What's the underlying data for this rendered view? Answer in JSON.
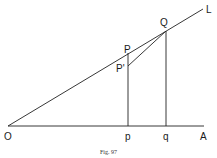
{
  "figure": {
    "caption": "Fig. 97",
    "labels": {
      "O": "O",
      "L": "L",
      "Q": "Q",
      "P": "P",
      "P_prime": "P'",
      "p": "p",
      "q": "q",
      "A": "A"
    },
    "points": {
      "O": [
        8,
        126
      ],
      "L": [
        203,
        9
      ],
      "Q": [
        166,
        31
      ],
      "P": [
        128,
        53
      ],
      "P_prime": [
        128,
        66
      ],
      "p": [
        128,
        126
      ],
      "q": [
        166,
        126
      ],
      "A": [
        204,
        126
      ]
    },
    "segments": [
      [
        "O",
        "L"
      ],
      [
        "O",
        "A"
      ],
      [
        "P",
        "p"
      ],
      [
        "Q",
        "q"
      ],
      [
        "P_prime",
        "Q"
      ]
    ],
    "colors": {
      "line": "#222222",
      "text": "#1a1a1a"
    }
  }
}
